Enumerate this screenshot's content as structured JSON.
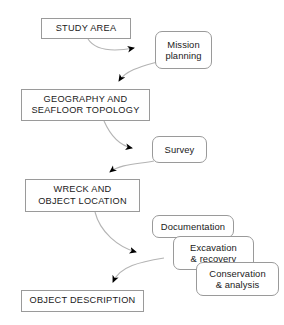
{
  "diagram": {
    "background_color": "#ffffff",
    "border_color": "#9a9a9a",
    "text_color": "#1a1a1a",
    "arrow_color": "#808080",
    "arrowhead_color": "#000000",
    "stage_nodes": [
      {
        "id": "study_area",
        "label": "STUDY AREA"
      },
      {
        "id": "geography",
        "label": "GEOGRAPHY AND\nSEAFLOOR TOPOLOGY"
      },
      {
        "id": "wreck",
        "label": "WRECK AND\nOBJECT LOCATION"
      },
      {
        "id": "object_description",
        "label": "OBJECT DESCRIPTION"
      }
    ],
    "activity_nodes": [
      {
        "id": "mission_planning",
        "label": "Mission\nplanning"
      },
      {
        "id": "survey",
        "label": "Survey"
      },
      {
        "id": "documentation",
        "label": "Documentation"
      },
      {
        "id": "excavation",
        "label": "Excavation\n& recovery"
      },
      {
        "id": "conservation",
        "label": "Conservation\n& analysis"
      }
    ],
    "connections": [
      {
        "from": "study_area",
        "to": "mission_planning"
      },
      {
        "from": "mission_planning",
        "to": "geography"
      },
      {
        "from": "geography",
        "to": "survey"
      },
      {
        "from": "survey",
        "to": "wreck"
      },
      {
        "from": "wreck",
        "to": "documentation_group"
      },
      {
        "from": "documentation_group",
        "to": "object_description"
      }
    ]
  }
}
